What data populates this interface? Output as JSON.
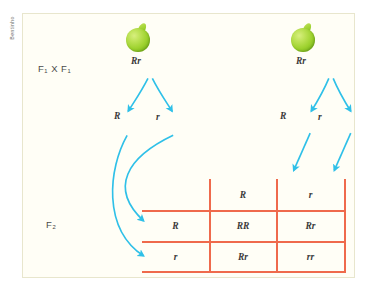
{
  "credit": {
    "text": "Bentinho"
  },
  "figure": {
    "generation_labels": {
      "f1_cross": "F₁  X  F₁",
      "f2": "F₂"
    },
    "parents": [
      {
        "name": "parent-left",
        "genotype": "Rr",
        "icon": "green-pea-icon"
      },
      {
        "name": "parent-right",
        "genotype": "Rr",
        "icon": "green-pea-icon"
      }
    ],
    "gametes": {
      "left": [
        {
          "allele": "R"
        },
        {
          "allele": "r"
        }
      ],
      "right": [
        {
          "allele": "R"
        },
        {
          "allele": "r"
        }
      ]
    },
    "punnett": {
      "corner": "",
      "column_headers": [
        "R",
        "r"
      ],
      "row_headers": [
        "R",
        "r"
      ],
      "cells": [
        [
          "RR",
          "Rr"
        ],
        [
          "Rr",
          "rr"
        ]
      ]
    },
    "colors": {
      "grid_line": "#ef6a4c",
      "arrow": "#2fc0e8",
      "pea": "#9ed22f",
      "panel_border": "#e8e6cd",
      "panel_background": "#fffef6"
    }
  }
}
